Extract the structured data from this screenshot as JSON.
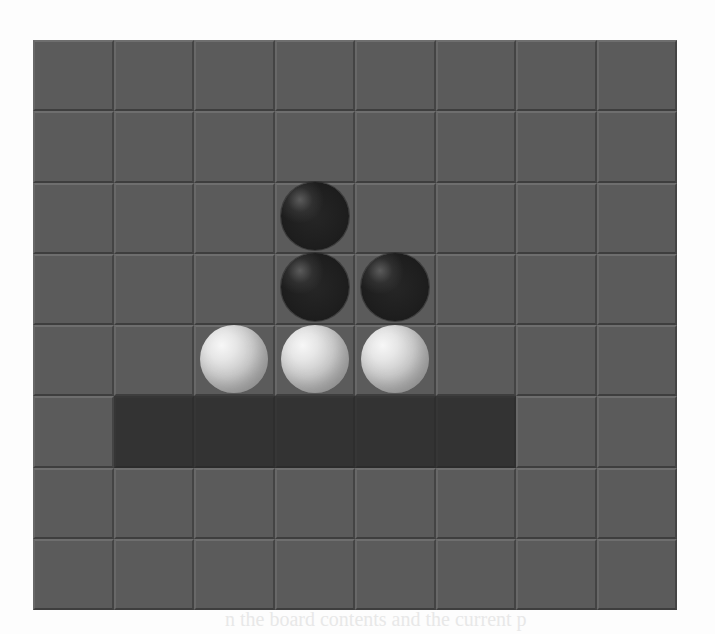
{
  "game": {
    "name": "Othello",
    "rows": 8,
    "cols": 8,
    "colors": {
      "cell": "#5b5b5b",
      "highlight": "#333333",
      "black_piece": "#1e1e1e",
      "white_piece": "#e6e6e6",
      "page_background": "#fdfdfd"
    },
    "pieces": [
      {
        "row": 2,
        "col": 3,
        "color": "black"
      },
      {
        "row": 3,
        "col": 3,
        "color": "black"
      },
      {
        "row": 3,
        "col": 4,
        "color": "black"
      },
      {
        "row": 4,
        "col": 2,
        "color": "white"
      },
      {
        "row": 4,
        "col": 3,
        "color": "white"
      },
      {
        "row": 4,
        "col": 4,
        "color": "white"
      }
    ],
    "highlighted_cells": [
      {
        "row": 5,
        "col": 1
      },
      {
        "row": 5,
        "col": 2
      },
      {
        "row": 5,
        "col": 3
      },
      {
        "row": 5,
        "col": 4
      },
      {
        "row": 5,
        "col": 5
      }
    ]
  },
  "background_text": {
    "bottom_line": "n the board contents and the current p"
  }
}
